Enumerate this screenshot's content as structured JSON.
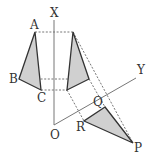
{
  "diagram": {
    "labels": {
      "axis_x": "X",
      "axis_y": "Y",
      "origin": "O",
      "point_a": "A",
      "point_b": "B",
      "point_c": "C",
      "point_p": "P",
      "point_q": "Q",
      "point_r": "R"
    },
    "colors": {
      "fill": "#d0d0d0",
      "stroke": "#333333",
      "axis": "#777777",
      "dashed": "#666666"
    }
  }
}
